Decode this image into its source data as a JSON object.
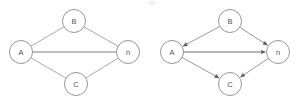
{
  "figure": {
    "title": "",
    "background_color": "#ffffff",
    "width": 298,
    "height": 105,
    "node_radius": 11.5,
    "node_fill": "#ffffff",
    "node_stroke": "#8a8a8a",
    "edge_color": "#9c9c9c",
    "arrow_color": "#5f5f5f",
    "label_color": "#555555"
  },
  "graphs": [
    {
      "id": "undirected-graph",
      "name": "left-undirected-graph",
      "directed": false,
      "caption": "",
      "nodes": [
        {
          "id": "A",
          "label": "A",
          "x": 21,
          "y": 52
        },
        {
          "id": "B",
          "label": "B",
          "x": 74,
          "y": 21
        },
        {
          "id": "n",
          "label": "n",
          "x": 128,
          "y": 52
        },
        {
          "id": "C",
          "label": "C",
          "x": 76,
          "y": 84
        }
      ],
      "edges": [
        {
          "from": "A",
          "to": "B",
          "emphasis": false
        },
        {
          "from": "B",
          "to": "n",
          "emphasis": false
        },
        {
          "from": "A",
          "to": "n",
          "emphasis": true
        },
        {
          "from": "A",
          "to": "C",
          "emphasis": false
        },
        {
          "from": "C",
          "to": "n",
          "emphasis": false
        }
      ]
    },
    {
      "id": "directed-graph",
      "name": "right-directed-graph",
      "directed": true,
      "caption": "",
      "nodes": [
        {
          "id": "A",
          "label": "A",
          "x": 172,
          "y": 52
        },
        {
          "id": "B",
          "label": "B",
          "x": 230,
          "y": 21
        },
        {
          "id": "n",
          "label": "n",
          "x": 278,
          "y": 52
        },
        {
          "id": "C",
          "label": "C",
          "x": 230,
          "y": 84
        }
      ],
      "edges": [
        {
          "from": "B",
          "to": "A",
          "emphasis": false
        },
        {
          "from": "B",
          "to": "n",
          "emphasis": false
        },
        {
          "from": "A",
          "to": "n",
          "emphasis": true
        },
        {
          "from": "A",
          "to": "C",
          "emphasis": false
        },
        {
          "from": "n",
          "to": "C",
          "emphasis": false
        }
      ]
    }
  ],
  "artifacts": [
    {
      "name": "scan-smudge",
      "x": 152,
      "y": 3,
      "rx": 3.5,
      "ry": 2.2
    }
  ]
}
